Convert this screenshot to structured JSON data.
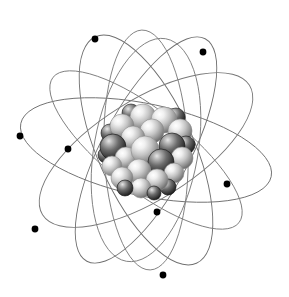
{
  "figure": {
    "name": "atom-model",
    "width": 289,
    "height": 297,
    "background_color": "#ffffff"
  },
  "colors": {
    "background": "#ffffff",
    "orbit_line": "#6f6f6f",
    "orbit_line_light": "#8a8a8a",
    "electron": "#000000",
    "nucleon_light_highlight": "#ffffff",
    "nucleon_light_mid": "#cfcfcf",
    "nucleon_light_edge": "#6a6a6a",
    "nucleon_dark_highlight": "#e8e8e8",
    "nucleon_dark_mid": "#6e6e6e",
    "nucleon_dark_edge": "#1a1a1a"
  },
  "nucleus": {
    "name": "atomic-nucleus",
    "center_x": 146,
    "center_y": 150,
    "radius": 41,
    "nucleon_count": 26,
    "nucleons": [
      {
        "id": "nucleon-01",
        "cx": 143,
        "cy": 117,
        "r": 13,
        "tone": "light",
        "depth": 1
      },
      {
        "id": "nucleon-02",
        "cx": 164,
        "cy": 120,
        "r": 13,
        "tone": "light",
        "depth": 1
      },
      {
        "id": "nucleon-03",
        "cx": 122,
        "cy": 126,
        "r": 12,
        "tone": "light",
        "depth": 1
      },
      {
        "id": "nucleon-04",
        "cx": 180,
        "cy": 131,
        "r": 12,
        "tone": "light",
        "depth": 1
      },
      {
        "id": "nucleon-05",
        "cx": 152,
        "cy": 131,
        "r": 12,
        "tone": "light",
        "depth": 2
      },
      {
        "id": "nucleon-06",
        "cx": 133,
        "cy": 138,
        "r": 12,
        "tone": "light",
        "depth": 2
      },
      {
        "id": "nucleon-07",
        "cx": 113,
        "cy": 147,
        "r": 13,
        "tone": "dark",
        "depth": 3
      },
      {
        "id": "nucleon-08",
        "cx": 172,
        "cy": 146,
        "r": 13,
        "tone": "dark",
        "depth": 3
      },
      {
        "id": "nucleon-09",
        "cx": 145,
        "cy": 150,
        "r": 14,
        "tone": "light",
        "depth": 4
      },
      {
        "id": "nucleon-10",
        "cx": 126,
        "cy": 158,
        "r": 11,
        "tone": "light",
        "depth": 3
      },
      {
        "id": "nucleon-11",
        "cx": 161,
        "cy": 162,
        "r": 13,
        "tone": "dark",
        "depth": 4
      },
      {
        "id": "nucleon-12",
        "cx": 182,
        "cy": 158,
        "r": 11,
        "tone": "light",
        "depth": 3
      },
      {
        "id": "nucleon-13",
        "cx": 112,
        "cy": 166,
        "r": 10,
        "tone": "light",
        "depth": 3
      },
      {
        "id": "nucleon-14",
        "cx": 139,
        "cy": 171,
        "r": 12,
        "tone": "light",
        "depth": 4
      },
      {
        "id": "nucleon-15",
        "cx": 122,
        "cy": 178,
        "r": 11,
        "tone": "light",
        "depth": 4
      },
      {
        "id": "nucleon-16",
        "cx": 157,
        "cy": 180,
        "r": 11,
        "tone": "light",
        "depth": 5
      },
      {
        "id": "nucleon-17",
        "cx": 174,
        "cy": 173,
        "r": 10,
        "tone": "light",
        "depth": 4
      },
      {
        "id": "nucleon-18",
        "cx": 141,
        "cy": 188,
        "r": 10,
        "tone": "light",
        "depth": 5
      },
      {
        "id": "nucleon-19",
        "cx": 131,
        "cy": 113,
        "r": 9,
        "tone": "dark",
        "depth": 0
      },
      {
        "id": "nucleon-20",
        "cx": 176,
        "cy": 117,
        "r": 9,
        "tone": "dark",
        "depth": 0
      },
      {
        "id": "nucleon-21",
        "cx": 110,
        "cy": 133,
        "r": 9,
        "tone": "dark",
        "depth": 0
      },
      {
        "id": "nucleon-22",
        "cx": 186,
        "cy": 145,
        "r": 9,
        "tone": "dark",
        "depth": 2
      },
      {
        "id": "nucleon-23",
        "cx": 106,
        "cy": 155,
        "r": 8,
        "tone": "dark",
        "depth": 2
      },
      {
        "id": "nucleon-24",
        "cx": 168,
        "cy": 187,
        "r": 8,
        "tone": "dark",
        "depth": 4
      },
      {
        "id": "nucleon-25",
        "cx": 125,
        "cy": 188,
        "r": 8,
        "tone": "dark",
        "depth": 5
      },
      {
        "id": "nucleon-26",
        "cx": 154,
        "cy": 193,
        "r": 7,
        "tone": "dark",
        "depth": 5
      }
    ]
  },
  "orbits": [
    {
      "id": "orbit-1",
      "name": "orbit-ellipse-1",
      "rx": 128,
      "ry": 46,
      "rotation": 12,
      "stroke": "#6f6f6f",
      "stroke_width": 0.9
    },
    {
      "id": "orbit-2",
      "name": "orbit-ellipse-2",
      "rx": 124,
      "ry": 48,
      "rotation": 66,
      "stroke": "#6f6f6f",
      "stroke_width": 0.9
    },
    {
      "id": "orbit-3",
      "name": "orbit-ellipse-3",
      "rx": 126,
      "ry": 44,
      "rotation": 118,
      "stroke": "#6f6f6f",
      "stroke_width": 0.9
    },
    {
      "id": "orbit-4",
      "name": "orbit-ellipse-4",
      "rx": 120,
      "ry": 42,
      "rotation": 88,
      "stroke": "#777777",
      "stroke_width": 0.9
    },
    {
      "id": "orbit-5",
      "name": "orbit-ellipse-5",
      "rx": 122,
      "ry": 50,
      "rotation": 148,
      "stroke": "#777777",
      "stroke_width": 0.9
    },
    {
      "id": "orbit-6",
      "name": "orbit-ellipse-6",
      "rx": 118,
      "ry": 40,
      "rotation": 38,
      "stroke": "#7d7d7d",
      "stroke_width": 0.9
    },
    {
      "id": "orbit-7",
      "name": "orbit-ellipse-7",
      "rx": 113,
      "ry": 52,
      "rotation": 100,
      "stroke": "#7d7d7d",
      "stroke_width": 0.9
    }
  ],
  "electrons": [
    {
      "id": "electron-1",
      "name": "electron-upper-left",
      "cx": 95,
      "cy": 39,
      "r": 3.4
    },
    {
      "id": "electron-2",
      "name": "electron-upper-right",
      "cx": 203,
      "cy": 52,
      "r": 3.4
    },
    {
      "id": "electron-3",
      "name": "electron-left-upper",
      "cx": 20,
      "cy": 136,
      "r": 3.4
    },
    {
      "id": "electron-4",
      "name": "electron-left-mid",
      "cx": 68,
      "cy": 149,
      "r": 3.4
    },
    {
      "id": "electron-5",
      "name": "electron-right-mid",
      "cx": 227,
      "cy": 184,
      "r": 3.4
    },
    {
      "id": "electron-6",
      "name": "electron-center-lower",
      "cx": 157,
      "cy": 212,
      "r": 3.4
    },
    {
      "id": "electron-7",
      "name": "electron-left-lower",
      "cx": 35,
      "cy": 229,
      "r": 3.4
    },
    {
      "id": "electron-8",
      "name": "electron-bottom",
      "cx": 163,
      "cy": 275,
      "r": 3.4
    },
    {
      "id": "electron-9",
      "name": "electron-right-low",
      "cx": 222,
      "cy": 183,
      "r": 0
    }
  ],
  "labels": {
    "caption": ""
  }
}
